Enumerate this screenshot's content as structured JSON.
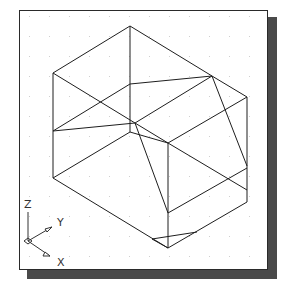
{
  "drawing": {
    "title": "Isometric wireframe view with UCS icon",
    "colors": {
      "background": "#ffffff",
      "frame": "#2a2a2a",
      "shadow": "#4a4a4a",
      "lines": "#1e1e1e",
      "grid_dots": "#cfcfcf"
    },
    "grid": {
      "spacing": 20,
      "visible": true
    },
    "ucs_icon": {
      "z_label": "Z",
      "y_label": "Y",
      "x_label": "X"
    },
    "edges": [
      [
        130,
        26,
        53,
        73
      ],
      [
        130,
        26,
        212,
        76
      ],
      [
        130,
        26,
        130,
        84
      ],
      [
        212,
        76,
        247,
        97
      ],
      [
        53,
        73,
        53,
        178
      ],
      [
        247,
        97,
        247,
        202
      ],
      [
        53,
        73,
        135,
        123
      ],
      [
        53,
        131,
        130,
        84
      ],
      [
        130,
        84,
        212,
        76
      ],
      [
        53,
        131,
        135,
        123
      ],
      [
        135,
        123,
        212,
        76
      ],
      [
        130,
        84,
        130,
        132
      ],
      [
        130,
        132,
        53,
        178
      ],
      [
        130,
        132,
        168,
        143
      ],
      [
        135,
        123,
        168,
        143
      ],
      [
        168,
        143,
        247,
        97
      ],
      [
        168,
        143,
        168,
        248
      ],
      [
        168,
        143,
        247,
        190
      ],
      [
        212,
        76,
        247,
        166
      ],
      [
        135,
        123,
        168,
        213
      ],
      [
        168,
        213,
        247,
        168
      ],
      [
        53,
        178,
        168,
        248
      ],
      [
        168,
        248,
        247,
        202
      ],
      [
        152,
        239,
        197,
        232
      ],
      [
        152,
        239,
        168,
        248
      ]
    ]
  }
}
